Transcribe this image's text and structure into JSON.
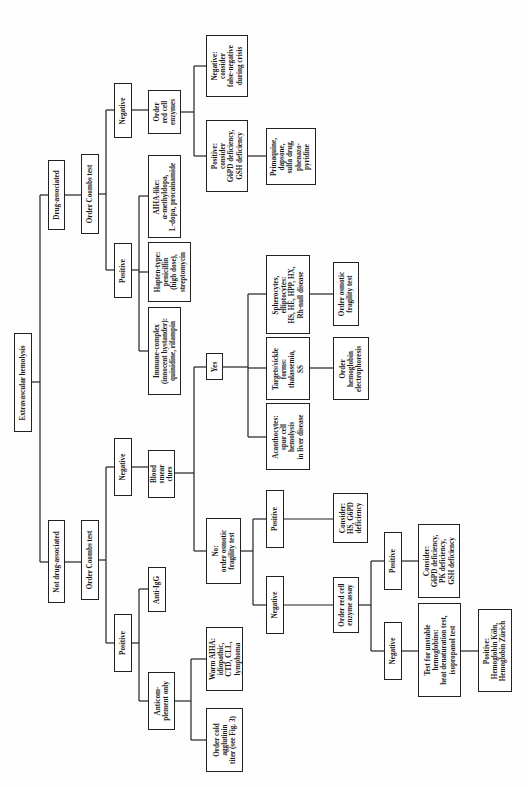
{
  "diagram": {
    "orientation": "rotated-90-ccw",
    "root": "Extravascular hemolysis",
    "nodes": [
      {
        "id": "root",
        "label": "Extravascular hemolysis",
        "x": 14,
        "y": 333,
        "w": 18,
        "h": 99
      },
      {
        "id": "drug",
        "label": "Drug-associated",
        "x": 48,
        "y": 160,
        "w": 17,
        "h": 70
      },
      {
        "id": "notdrug",
        "label": "Not drug-associated",
        "x": 48,
        "y": 520,
        "w": 17,
        "h": 83
      },
      {
        "id": "coombs_drug",
        "label": "Order Coombs test",
        "x": 81,
        "y": 154,
        "w": 18,
        "h": 80
      },
      {
        "id": "coombs_notdrug",
        "label": "Order Coombs test",
        "x": 81,
        "y": 520,
        "w": 18,
        "h": 80
      },
      {
        "id": "neg_drug",
        "label": "Negative",
        "x": 114,
        "y": 83,
        "w": 18,
        "h": 55
      },
      {
        "id": "pos_drug",
        "label": "Positive",
        "x": 114,
        "y": 243,
        "w": 18,
        "h": 55
      },
      {
        "id": "rbc_enz",
        "label": "Order\nred cell\nenzymes",
        "x": 148,
        "y": 90,
        "w": 33,
        "h": 44
      },
      {
        "id": "falseneg",
        "label": "Negative:\nconsider\nfalse-negative\nduring crisis",
        "x": 206,
        "y": 35,
        "w": 42,
        "h": 62
      },
      {
        "id": "g6pd_pos",
        "label": "Positive:\nconsider\nG6PD deficiency,\nGSH deficiency",
        "x": 206,
        "y": 120,
        "w": 42,
        "h": 72
      },
      {
        "id": "primaquine",
        "label": "Primaquine,\ndapsone,\nsulfa drug,\nphenazo-\npyridine",
        "x": 266,
        "y": 128,
        "w": 50,
        "h": 57
      },
      {
        "id": "aiha_like",
        "label": "AIHA-like:\nα-methyldopa,\nL-dopa, procainamide",
        "x": 148,
        "y": 155,
        "w": 33,
        "h": 83
      },
      {
        "id": "hapten",
        "label": "Hapten-type:\npenicillin\n(high dose),\nstreptomycin",
        "x": 148,
        "y": 242,
        "w": 43,
        "h": 60
      },
      {
        "id": "immune",
        "label": "Immune-complex\n(innocent bystander):\nquinidine, rifampin",
        "x": 148,
        "y": 307,
        "w": 33,
        "h": 88
      },
      {
        "id": "neg_notdrug",
        "label": "Negative",
        "x": 114,
        "y": 438,
        "w": 18,
        "h": 58
      },
      {
        "id": "smear",
        "label": "Blood\nsmear\nclues",
        "x": 148,
        "y": 450,
        "w": 27,
        "h": 48
      },
      {
        "id": "pos_notdrug",
        "label": "Positive",
        "x": 114,
        "y": 614,
        "w": 18,
        "h": 58
      },
      {
        "id": "antiigg",
        "label": "Anti-IgG",
        "x": 148,
        "y": 567,
        "w": 18,
        "h": 45
      },
      {
        "id": "anticomp",
        "label": "Anticom-\nplement only",
        "x": 148,
        "y": 672,
        "w": 27,
        "h": 58
      },
      {
        "id": "warm",
        "label": "Warm AIHA:\nidiopathic,\nCTD, CLL,\nlymphoma",
        "x": 206,
        "y": 627,
        "w": 37,
        "h": 64
      },
      {
        "id": "cold",
        "label": "Order cold\nagglutinin\ntiter (see Fig. 3)",
        "x": 206,
        "y": 708,
        "w": 37,
        "h": 64
      },
      {
        "id": "yes",
        "label": "Yes",
        "x": 206,
        "y": 353,
        "w": 17,
        "h": 27
      },
      {
        "id": "acantho",
        "label": "Acanthocytes:\nspur cell\nhemolysis\nin liver disease",
        "x": 266,
        "y": 403,
        "w": 44,
        "h": 67
      },
      {
        "id": "target",
        "label": "Targets/sickle\nforms:\nthalassemia,\nSS",
        "x": 266,
        "y": 337,
        "w": 44,
        "h": 63
      },
      {
        "id": "sphero",
        "label": "Spherocytes,\nelliptocytes:\nHS, HE, HPP, HX,\nRh-null disease",
        "x": 266,
        "y": 255,
        "w": 44,
        "h": 79
      },
      {
        "id": "hb_electro",
        "label": "Order\nhemoglobin\nelectrophoresis",
        "x": 333,
        "y": 337,
        "w": 36,
        "h": 63
      },
      {
        "id": "osm_frag_yes",
        "label": "Order osmotic\nfragility test",
        "x": 333,
        "y": 262,
        "w": 26,
        "h": 64
      },
      {
        "id": "no_osm",
        "label": "No:\norder osmotic\nfragility test",
        "x": 206,
        "y": 518,
        "w": 35,
        "h": 66
      },
      {
        "id": "pos_osm",
        "label": "Positive",
        "x": 266,
        "y": 490,
        "w": 18,
        "h": 58
      },
      {
        "id": "neg_osm",
        "label": "Negative",
        "x": 266,
        "y": 576,
        "w": 18,
        "h": 58
      },
      {
        "id": "hs_g6pd",
        "label": "Consider:\nHS, G6PD\ndeficiency",
        "x": 333,
        "y": 493,
        "w": 35,
        "h": 50
      },
      {
        "id": "enz_assay",
        "label": "Order red cell\nenzyme assay",
        "x": 333,
        "y": 577,
        "w": 26,
        "h": 56
      },
      {
        "id": "pos_enz",
        "label": "Positive",
        "x": 384,
        "y": 532,
        "w": 18,
        "h": 58
      },
      {
        "id": "neg_enz",
        "label": "Negative",
        "x": 384,
        "y": 622,
        "w": 18,
        "h": 58
      },
      {
        "id": "g6pd_pk_gsh",
        "label": "Consider:\nG6PD deficiency,\nPK deficiency,\nGSH deficiency",
        "x": 418,
        "y": 524,
        "w": 42,
        "h": 74
      },
      {
        "id": "unstable_hb",
        "label": "Test for unstable\nhemoglobins:\nheat denaturation test,\nisopropanol test",
        "x": 418,
        "y": 603,
        "w": 43,
        "h": 94
      },
      {
        "id": "hb_koln",
        "label": "Positive:\nHemoglobin Köln,\nHemoglobin Zürich",
        "x": 478,
        "y": 609,
        "w": 34,
        "h": 83
      }
    ],
    "lines": [
      [
        32,
        382,
        40,
        382
      ],
      [
        40,
        195,
        40,
        562
      ],
      [
        40,
        195,
        48,
        195
      ],
      [
        40,
        562,
        48,
        562
      ],
      [
        65,
        195,
        81,
        195
      ],
      [
        65,
        562,
        81,
        562
      ],
      [
        99,
        194,
        106,
        194
      ],
      [
        106,
        110,
        106,
        270
      ],
      [
        106,
        110,
        114,
        110
      ],
      [
        106,
        270,
        114,
        270
      ],
      [
        132,
        110,
        148,
        110
      ],
      [
        181,
        112,
        194,
        112
      ],
      [
        194,
        66,
        194,
        156
      ],
      [
        194,
        66,
        206,
        66
      ],
      [
        194,
        156,
        206,
        156
      ],
      [
        248,
        156,
        266,
        156
      ],
      [
        132,
        270,
        139,
        270
      ],
      [
        139,
        196,
        139,
        351
      ],
      [
        139,
        196,
        148,
        196
      ],
      [
        139,
        272,
        148,
        272
      ],
      [
        139,
        351,
        148,
        351
      ],
      [
        99,
        560,
        106,
        560
      ],
      [
        106,
        467,
        106,
        643
      ],
      [
        106,
        467,
        114,
        467
      ],
      [
        106,
        643,
        114,
        643
      ],
      [
        132,
        467,
        148,
        467
      ],
      [
        132,
        643,
        139,
        643
      ],
      [
        139,
        589,
        139,
        701
      ],
      [
        139,
        589,
        148,
        589
      ],
      [
        139,
        701,
        148,
        701
      ],
      [
        175,
        701,
        191,
        701
      ],
      [
        191,
        659,
        191,
        740
      ],
      [
        191,
        659,
        206,
        659
      ],
      [
        191,
        740,
        206,
        740
      ],
      [
        175,
        473,
        194,
        473
      ],
      [
        194,
        367,
        194,
        551
      ],
      [
        194,
        367,
        206,
        367
      ],
      [
        194,
        551,
        206,
        551
      ],
      [
        223,
        367,
        248,
        367
      ],
      [
        248,
        294,
        248,
        437
      ],
      [
        248,
        294,
        266,
        294
      ],
      [
        248,
        368,
        266,
        368
      ],
      [
        248,
        437,
        266,
        437
      ],
      [
        310,
        294,
        333,
        294
      ],
      [
        310,
        368,
        333,
        368
      ],
      [
        241,
        551,
        253,
        551
      ],
      [
        253,
        519,
        253,
        605
      ],
      [
        253,
        519,
        266,
        519
      ],
      [
        253,
        605,
        266,
        605
      ],
      [
        284,
        519,
        333,
        519
      ],
      [
        284,
        605,
        333,
        605
      ],
      [
        359,
        605,
        371,
        605
      ],
      [
        371,
        561,
        371,
        651
      ],
      [
        371,
        561,
        384,
        561
      ],
      [
        371,
        651,
        384,
        651
      ],
      [
        402,
        561,
        418,
        561
      ],
      [
        402,
        651,
        418,
        651
      ],
      [
        461,
        651,
        478,
        651
      ]
    ]
  }
}
